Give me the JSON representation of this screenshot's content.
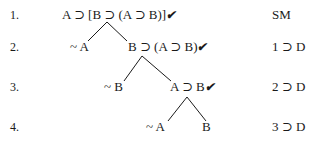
{
  "tree": {
    "rows": [
      {
        "line_number": "1.",
        "justification": "SM"
      },
      {
        "line_number": "2.",
        "justification": "1 ⊃ D"
      },
      {
        "line_number": "3.",
        "justification": "2 ⊃ D"
      },
      {
        "line_number": "4.",
        "justification": "3 ⊃ D"
      }
    ],
    "nodes": {
      "root": {
        "formula": "A ⊃ [B ⊃ (A ⊃ B)]",
        "checked": "✔"
      },
      "r2_left": {
        "formula": "~ A"
      },
      "r2_right": {
        "formula": "B ⊃ (A ⊃ B)",
        "checked": "✔"
      },
      "r3_left": {
        "formula": "~ B"
      },
      "r3_right": {
        "formula": "A ⊃ B",
        "checked": "✔"
      },
      "r4_left": {
        "formula": "~ A"
      },
      "r4_right": {
        "formula": "B"
      }
    }
  }
}
